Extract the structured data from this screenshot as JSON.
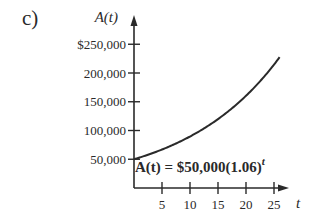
{
  "part_label": "c)",
  "chart_data": {
    "type": "line",
    "title": "",
    "xlabel": "t",
    "ylabel": "A(t)",
    "function": "A(t) = 50000 * 1.06^t",
    "annotation": {
      "text_prefix": "A(t) = $50,000(1.06)",
      "exponent": "t"
    },
    "x_ticks": [
      5,
      10,
      15,
      20,
      25
    ],
    "x_tick_labels": [
      "5",
      "10",
      "15",
      "20",
      "25"
    ],
    "y_ticks": [
      50000,
      100000,
      150000,
      200000,
      250000
    ],
    "y_tick_labels": [
      "50,000",
      "100,000",
      "150,000",
      "200,000",
      "$250,000"
    ],
    "xlim": [
      0,
      27
    ],
    "ylim": [
      0,
      270000
    ],
    "grid": false,
    "series": [
      {
        "name": "A(t)",
        "x": [
          0,
          5,
          10,
          15,
          20,
          25,
          26
        ],
        "values": [
          50000,
          66911,
          89542,
          119828,
          160357,
          214594,
          227470
        ]
      }
    ],
    "curve_t_range": [
      0,
      26
    ],
    "line_color": "#2a2a2a"
  }
}
